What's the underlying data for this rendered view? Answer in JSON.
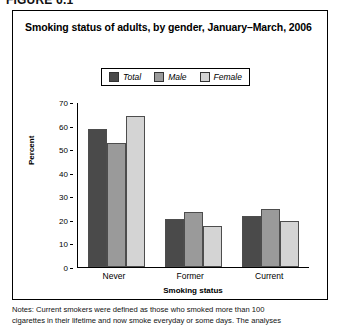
{
  "figure_label": "FIGURE 6.1",
  "chart_title": "Smoking status of adults, by gender, January–March, 2006",
  "legend": {
    "items": [
      {
        "label": "Total",
        "color": "#4a4a4a"
      },
      {
        "label": "Male",
        "color": "#9a9a9a"
      },
      {
        "label": "Female",
        "color": "#d4d4d4"
      }
    ]
  },
  "notes": {
    "line1": "Notes: Current smokers were defined as those who smoked more than 100",
    "line2": "cigarettes in their lifetime and now smoke everyday or some days. The analyses"
  },
  "chart_data": {
    "type": "bar",
    "title": "Smoking status of adults, by gender, January–March, 2006",
    "xlabel": "Smoking status",
    "ylabel": "Percent",
    "ylim": [
      0,
      70
    ],
    "yticks": [
      0,
      10,
      20,
      30,
      40,
      50,
      60,
      70
    ],
    "grid": false,
    "legend_position": "top-center",
    "categories": [
      "Never",
      "Former",
      "Current"
    ],
    "series": [
      {
        "name": "Total",
        "color": "#4a4a4a",
        "values": [
          58.5,
          20.5,
          21.8
        ]
      },
      {
        "name": "Male",
        "color": "#9a9a9a",
        "values": [
          52.8,
          23.2,
          24.7
        ]
      },
      {
        "name": "Female",
        "color": "#d4d4d4",
        "values": [
          64.0,
          17.5,
          19.5
        ]
      }
    ]
  }
}
